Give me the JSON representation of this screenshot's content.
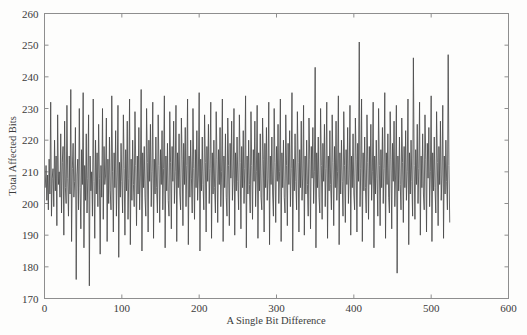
{
  "chart_data": {
    "type": "line",
    "title": "",
    "subtitle": "",
    "xlabel": "A Single Bit Difference",
    "ylabel": "Total Affected Bits",
    "xlim": [
      0,
      600
    ],
    "ylim": [
      170,
      260
    ],
    "xticks": [
      0,
      100,
      200,
      300,
      400,
      500,
      600
    ],
    "yticks": [
      170,
      180,
      190,
      200,
      210,
      220,
      230,
      240,
      250,
      260
    ],
    "grid": false,
    "legend": null,
    "legend_position": "none",
    "series": [
      {
        "name": "Total Affected Bits",
        "color": "#4a4a4a",
        "x_start": 1,
        "x_step": 1,
        "n_points": 512,
        "y_min": 174,
        "y_max": 251,
        "y_mean": 210,
        "values": [
          205,
          212,
          201,
          209,
          198,
          214,
          203,
          232,
          196,
          208,
          211,
          199,
          220,
          204,
          215,
          193,
          228,
          206,
          210,
          202,
          222,
          197,
          213,
          218,
          190,
          226,
          205,
          200,
          231,
          208,
          196,
          215,
          203,
          236,
          188,
          211,
          219,
          202,
          207,
          224,
          176,
          209,
          214,
          198,
          230,
          205,
          192,
          217,
          206,
          235,
          186,
          212,
          201,
          222,
          197,
          208,
          228,
          174,
          215,
          204,
          210,
          196,
          233,
          207,
          189,
          220,
          203,
          216,
          199,
          225,
          208,
          184,
          212,
          202,
          230,
          195,
          218,
          206,
          209,
          227,
          188,
          214,
          200,
          221,
          204,
          198,
          234,
          210,
          191,
          216,
          205,
          223,
          196,
          209,
          231,
          183,
          213,
          202,
          219,
          207,
          197,
          228,
          211,
          190,
          217,
          204,
          226,
          195,
          208,
          233,
          187,
          214,
          201,
          220,
          206,
          199,
          229,
          212,
          193,
          215,
          203,
          224,
          198,
          209,
          236,
          185,
          216,
          205,
          218,
          202,
          196,
          230,
          213,
          191,
          220,
          207,
          225,
          199,
          210,
          232,
          189,
          214,
          203,
          221,
          205,
          197,
          228,
          212,
          194,
          217,
          206,
          223,
          198,
          211,
          234,
          186,
          215,
          204,
          219,
          201,
          196,
          229,
          213,
          192,
          218,
          207,
          226,
          200,
          210,
          231,
          188,
          216,
          205,
          222,
          203,
          198,
          227,
          214,
          193,
          219,
          206,
          224,
          199,
          212,
          233,
          187,
          215,
          202,
          220,
          208,
          197,
          230,
          211,
          195,
          217,
          205,
          223,
          201,
          209,
          235,
          185,
          214,
          204,
          221,
          206,
          198,
          228,
          213,
          191,
          218,
          207,
          225,
          200,
          211,
          232,
          189,
          216,
          203,
          220,
          205,
          197,
          229,
          214,
          194,
          217,
          206,
          224,
          199,
          210,
          233,
          188,
          215,
          205,
          222,
          202,
          196,
          227,
          212,
          193,
          219,
          208,
          226,
          201,
          209,
          230,
          190,
          216,
          204,
          221,
          207,
          198,
          228,
          213,
          192,
          218,
          205,
          223,
          200,
          211,
          234,
          186,
          215,
          203,
          220,
          206,
          197,
          229,
          212,
          195,
          217,
          207,
          226,
          199,
          210,
          231,
          189,
          216,
          204,
          222,
          202,
          198,
          227,
          214,
          191,
          219,
          205,
          224,
          201,
          208,
          232,
          187,
          215,
          206,
          221,
          203,
          196,
          230,
          213,
          194,
          218,
          207,
          225,
          200,
          210,
          233,
          188,
          216,
          205,
          220,
          202,
          197,
          228,
          212,
          193,
          219,
          206,
          223,
          199,
          211,
          235,
          185,
          214,
          204,
          222,
          207,
          198,
          229,
          213,
          191,
          217,
          205,
          226,
          201,
          209,
          231,
          190,
          215,
          203,
          220,
          206,
          196,
          227,
          214,
          192,
          218,
          208,
          224,
          200,
          210,
          243,
          186,
          216,
          205,
          221,
          202,
          197,
          230,
          212,
          195,
          219,
          207,
          225,
          199,
          211,
          232,
          189,
          215,
          204,
          223,
          206,
          198,
          228,
          213,
          193,
          218,
          205,
          226,
          201,
          210,
          234,
          187,
          216,
          203,
          220,
          207,
          196,
          229,
          212,
          194,
          217,
          206,
          224,
          200,
          209,
          231,
          190,
          215,
          205,
          222,
          203,
          198,
          227,
          214,
          191,
          219,
          207,
          251,
          199,
          211,
          233,
          188,
          216,
          204,
          221,
          205,
          197,
          228,
          213,
          195,
          218,
          206,
          225,
          201,
          210,
          232,
          186,
          215,
          203,
          220,
          208,
          196,
          230,
          212,
          193,
          217,
          205,
          224,
          200,
          211,
          235,
          189,
          216,
          206,
          222,
          202,
          197,
          229,
          214,
          192,
          219,
          207,
          226,
          199,
          209,
          231,
          178,
          215,
          204,
          221,
          206,
          198,
          227,
          213,
          194,
          218,
          205,
          223,
          201,
          210,
          233,
          187,
          216,
          203,
          220,
          207,
          196,
          246,
          212,
          195,
          217,
          206,
          225,
          200,
          211,
          232,
          190,
          215,
          205,
          222,
          203,
          198,
          228,
          214,
          191,
          219,
          208,
          224,
          199,
          210,
          234,
          188,
          216,
          204,
          221,
          205,
          197,
          229,
          213,
          193,
          218,
          206,
          226,
          201,
          209,
          231,
          189,
          215,
          203,
          220,
          207,
          198,
          247,
          212,
          194
        ]
      }
    ]
  }
}
